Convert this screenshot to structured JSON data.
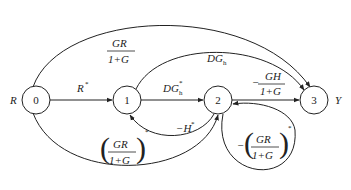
{
  "diagram": {
    "type": "signal-flow-graph",
    "input_label": "R",
    "output_label": "Y",
    "nodes": [
      {
        "id": "0",
        "label": "0"
      },
      {
        "id": "1",
        "label": "1"
      },
      {
        "id": "2",
        "label": "2"
      },
      {
        "id": "3",
        "label": "3"
      }
    ],
    "edges": [
      {
        "from": "0",
        "to": "1",
        "label": "R*",
        "base": "R",
        "sup": "*"
      },
      {
        "from": "1",
        "to": "2",
        "label": "DG_h*",
        "base": "DG",
        "sub": "h",
        "sup": "*"
      },
      {
        "from": "2",
        "to": "3",
        "label": "-GH/(1+G)",
        "sign": "−",
        "num": "GH",
        "den": "1+G"
      },
      {
        "from": "0",
        "to": "3",
        "label": "GR/(1+G)",
        "num": "GR",
        "den": "1+G"
      },
      {
        "from": "1",
        "to": "3",
        "label": "DG_h",
        "base": "DG",
        "sub": "h"
      },
      {
        "from": "2",
        "to": "1",
        "label": "-H*",
        "base": "−H",
        "sup": "*"
      },
      {
        "from": "0",
        "to": "2",
        "label": "(GR/(1+G))*",
        "num": "GR",
        "den": "1+G",
        "sup": "*"
      },
      {
        "from": "2",
        "to": "2",
        "label": "-(GR/(1+G))*",
        "sign": "−",
        "num": "GR",
        "den": "1+G",
        "sup": "*"
      }
    ]
  }
}
